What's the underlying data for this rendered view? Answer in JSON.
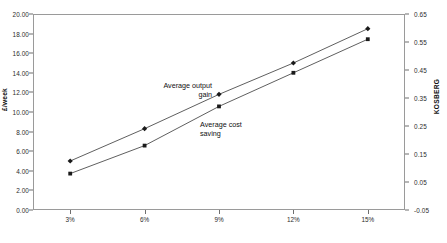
{
  "chart_data": {
    "type": "scatter",
    "title": "",
    "subtitle": "",
    "xlabel": "",
    "ylabel": "£/week",
    "ylabel_secondary": "KOSBERG",
    "categories": [
      "3%",
      "6%",
      "9%",
      "12%",
      "15%"
    ],
    "x": [
      3,
      6,
      9,
      12,
      15
    ],
    "grid": false,
    "legend_position": "none",
    "ylim": [
      0.0,
      20.0
    ],
    "ylim_secondary": [
      -0.05,
      0.65
    ],
    "ytick_labels": [
      "20.00",
      "18.00",
      "16.00",
      "14.00",
      "12.00",
      "10.00",
      "8.00",
      "6.00",
      "4.00",
      "2.00",
      "0.00"
    ],
    "ytick_values": [
      20.0,
      18.0,
      16.0,
      14.0,
      12.0,
      10.0,
      8.0,
      6.0,
      4.0,
      2.0,
      0.0
    ],
    "ytick_labels_secondary": [
      "0.65",
      "0.55",
      "0.45",
      "0.35",
      "0.25",
      "0.15",
      "0.05",
      "-0.05"
    ],
    "ytick_values_secondary": [
      0.65,
      0.55,
      0.45,
      0.35,
      0.25,
      0.15,
      0.05,
      -0.05
    ],
    "series": [
      {
        "name": "Average output gain",
        "axis": "left",
        "marker": "diamond",
        "color": "#1a1a1a",
        "values": [
          5.0,
          8.3,
          11.8,
          15.0,
          18.5
        ]
      },
      {
        "name": "Average cost saving",
        "axis": "right",
        "marker": "square",
        "color": "#1a1a1a",
        "values": [
          0.08,
          0.18,
          0.32,
          0.44,
          0.56
        ]
      }
    ],
    "annotations": [
      {
        "id": "output-gain",
        "text": "Average output\ngain"
      },
      {
        "id": "cost-saving",
        "text": "Average cost\nsaving"
      }
    ]
  },
  "caption": {
    "text": ""
  }
}
